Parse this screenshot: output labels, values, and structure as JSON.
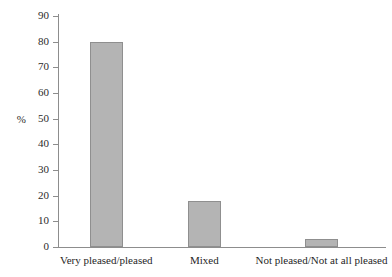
{
  "chart_data": {
    "type": "bar",
    "title": "",
    "subtitle": "",
    "xlabel": "",
    "ylabel": "%",
    "categories": [
      "Very pleased/pleased",
      "Mixed",
      "Not pleased/Not at all pleased"
    ],
    "values": [
      80,
      18,
      3
    ],
    "series": [
      {
        "name": "",
        "values": [
          80,
          18,
          3
        ]
      }
    ],
    "ylim": [
      0,
      90
    ],
    "ytick_step": 10,
    "yticks": [
      0,
      10,
      20,
      30,
      40,
      50,
      60,
      70,
      80,
      90
    ],
    "ytick_labels": [
      "0",
      "10",
      "20",
      "30",
      "40",
      "50",
      "60",
      "70",
      "80",
      "90"
    ],
    "grid": false,
    "legend": false,
    "legend_position": "none",
    "bar_color": "#b4b4b4",
    "bar_border_color": "#8f8f8f",
    "axis_color": "#8d8d8d",
    "background_color": "#ffffff",
    "text_color": "#1f1f1f"
  }
}
